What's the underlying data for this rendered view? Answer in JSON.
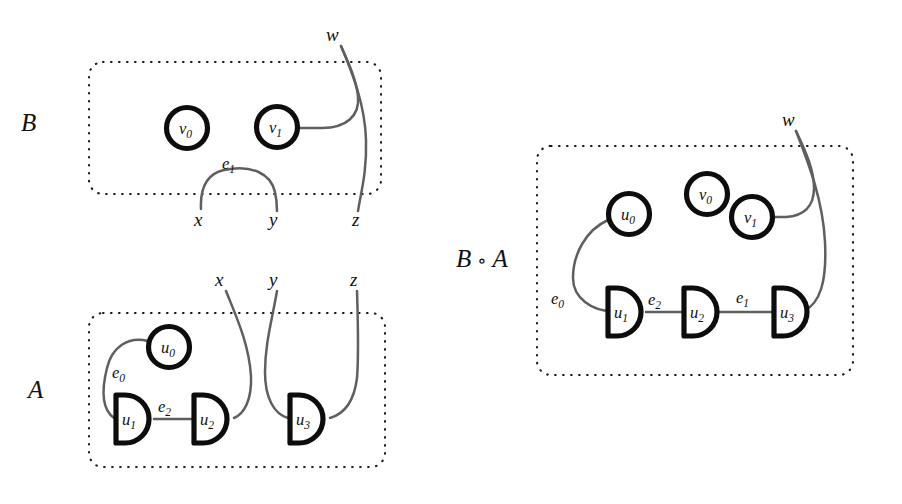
{
  "figure": {
    "background_color": "#ffffff",
    "ink_color": "#0d0d0d",
    "wire_color": "#5f5f5f",
    "width": 902,
    "height": 504
  },
  "panels": {
    "b": {
      "label_letter": "B",
      "label_full": "B",
      "nodes": [
        {
          "id": "v0",
          "base": "v",
          "sub": "0",
          "shape": "circle"
        },
        {
          "id": "v1",
          "base": "v",
          "sub": "1",
          "shape": "circle"
        }
      ],
      "edges": [
        {
          "id": "e1",
          "base": "e",
          "sub": "1"
        }
      ],
      "ports": [
        {
          "id": "x",
          "label": "x",
          "side": "bottom"
        },
        {
          "id": "y",
          "label": "y",
          "side": "bottom"
        },
        {
          "id": "z",
          "label": "z",
          "side": "bottom"
        },
        {
          "id": "w",
          "label": "w",
          "side": "top"
        }
      ]
    },
    "a": {
      "label_letter": "A",
      "label_full": "A",
      "nodes": [
        {
          "id": "u0",
          "base": "u",
          "sub": "0",
          "shape": "circle"
        },
        {
          "id": "u1",
          "base": "u",
          "sub": "1",
          "shape": "d-shape"
        },
        {
          "id": "u2",
          "base": "u",
          "sub": "2",
          "shape": "d-shape"
        },
        {
          "id": "u3",
          "base": "u",
          "sub": "3",
          "shape": "d-shape"
        }
      ],
      "edges": [
        {
          "id": "e0",
          "base": "e",
          "sub": "0"
        },
        {
          "id": "e2",
          "base": "e",
          "sub": "2"
        }
      ],
      "ports": [
        {
          "id": "x",
          "label": "x",
          "side": "top"
        },
        {
          "id": "y",
          "label": "y",
          "side": "top"
        },
        {
          "id": "z",
          "label": "z",
          "side": "top"
        }
      ]
    },
    "composite": {
      "label_letter": "B",
      "label_op": "∘",
      "label_letter2": "A",
      "label_full": "B ∘ A",
      "nodes": [
        {
          "id": "u0",
          "base": "u",
          "sub": "0",
          "shape": "circle"
        },
        {
          "id": "v0",
          "base": "v",
          "sub": "0",
          "shape": "circle"
        },
        {
          "id": "v1",
          "base": "v",
          "sub": "1",
          "shape": "circle"
        },
        {
          "id": "u1",
          "base": "u",
          "sub": "1",
          "shape": "d-shape"
        },
        {
          "id": "u2",
          "base": "u",
          "sub": "2",
          "shape": "d-shape"
        },
        {
          "id": "u3",
          "base": "u",
          "sub": "3",
          "shape": "d-shape"
        }
      ],
      "edges": [
        {
          "id": "e0",
          "base": "e",
          "sub": "0"
        },
        {
          "id": "e2",
          "base": "e",
          "sub": "2"
        },
        {
          "id": "e1",
          "base": "e",
          "sub": "1"
        }
      ],
      "ports": [
        {
          "id": "w",
          "label": "w",
          "side": "top"
        }
      ]
    }
  }
}
